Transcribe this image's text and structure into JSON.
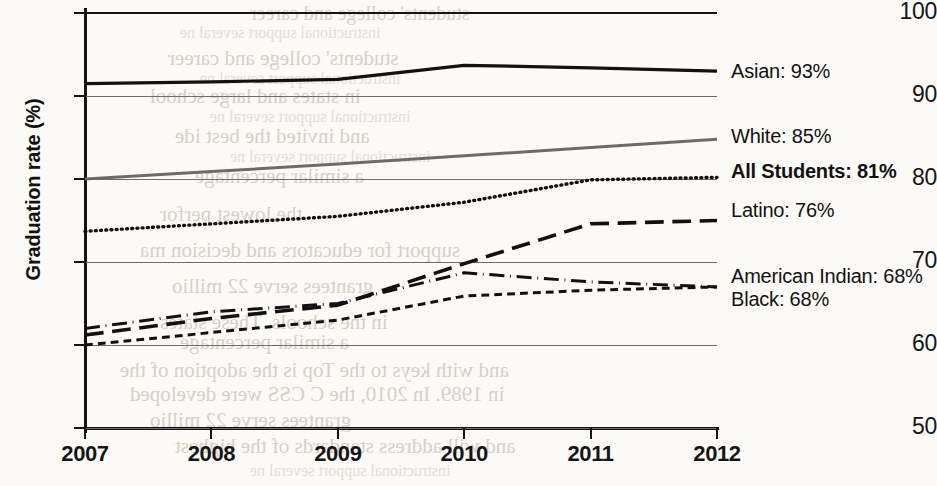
{
  "chart_data": {
    "type": "line",
    "title": "",
    "xlabel": "",
    "ylabel": "Graduation rate (%)",
    "categories": [
      "2007",
      "2008",
      "2009",
      "2010",
      "2011",
      "2012"
    ],
    "x": [
      2007,
      2008,
      2009,
      2010,
      2011,
      2012
    ],
    "ylim": [
      50,
      100
    ],
    "yticks": [
      50,
      60,
      70,
      80,
      90,
      100
    ],
    "grid": true,
    "legend_position": "right",
    "series": [
      {
        "name": "Asian",
        "label": "Asian: 93%",
        "final_value": 93,
        "style": "solid",
        "color": "#111111",
        "width": 3.2,
        "values": [
          91.5,
          91.7,
          92.0,
          93.7,
          93.4,
          93.0
        ]
      },
      {
        "name": "White",
        "label": "White: 85%",
        "final_value": 85,
        "style": "solid",
        "color": "#6b6b6b",
        "width": 3.0,
        "values": [
          80.0,
          80.9,
          81.8,
          82.8,
          83.8,
          84.8
        ]
      },
      {
        "name": "All Students",
        "label": "All Students: 81%",
        "final_value": 81,
        "style": "dotted",
        "color": "#111111",
        "width": 3.4,
        "bold_label": true,
        "values": [
          73.7,
          74.6,
          75.5,
          77.2,
          79.9,
          80.2
        ]
      },
      {
        "name": "Latino",
        "label": "Latino: 76%",
        "final_value": 76,
        "style": "long-dash",
        "color": "#111111",
        "width": 3.6,
        "values": [
          61.2,
          63.2,
          64.8,
          69.8,
          74.6,
          75.0
        ]
      },
      {
        "name": "American Indian",
        "label": "American Indian: 68%",
        "final_value": 68,
        "style": "dash-dot",
        "color": "#111111",
        "width": 3.0,
        "values": [
          62.0,
          64.0,
          65.0,
          68.7,
          67.6,
          67.0
        ]
      },
      {
        "name": "Black",
        "label": "Black: 68%",
        "final_value": 68,
        "style": "short-dash",
        "color": "#111111",
        "width": 3.0,
        "values": [
          60.0,
          61.5,
          63.0,
          65.9,
          66.6,
          67.0
        ]
      }
    ]
  },
  "axis": {
    "y_title": "Graduation rate (%)",
    "y_ticks": [
      "100",
      "90",
      "80",
      "70",
      "60",
      "50"
    ],
    "x_ticks": [
      "2007",
      "2008",
      "2009",
      "2010",
      "2011",
      "2012"
    ]
  },
  "legend": {
    "entries": [
      {
        "label": "Asian: 93%",
        "bold": false
      },
      {
        "label": "White: 85%",
        "bold": false
      },
      {
        "label": "All Students: 81%",
        "bold": true
      },
      {
        "label": "Latino: 76%",
        "bold": false
      },
      {
        "label": "American Indian: 68%",
        "bold": false
      },
      {
        "label": "Black: 68%",
        "bold": false
      }
    ]
  },
  "background_bleed": {
    "lines": [
      "students' college and career",
      "instructional support several ne",
      "in states and large school",
      "and invited the best ide",
      "the lowest perfor",
      "support for educators and decision ma",
      "grantees serve 22 millio",
      "in the schools. These states",
      "a similar percentage",
      "and with keys to the Top is the adoption of the",
      "in 1989. In 2010, the C CSS were developed",
      "and will address standards of the highest"
    ]
  }
}
